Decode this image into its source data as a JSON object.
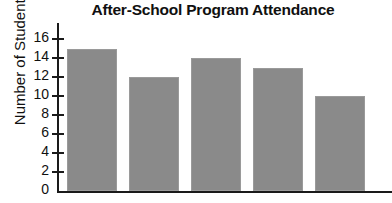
{
  "chart_data": {
    "type": "bar",
    "title": "After-School Program Attendance",
    "xlabel": "",
    "ylabel": "Number of Students",
    "categories": [
      "",
      "",
      "",
      "",
      ""
    ],
    "values": [
      15,
      12,
      14,
      13,
      10
    ],
    "ylim": [
      0,
      16
    ],
    "ytick_labels": [
      "0",
      "2",
      "4",
      "6",
      "8",
      "10",
      "12",
      "14",
      "16"
    ],
    "ytick_values": [
      0,
      2,
      4,
      6,
      8,
      10,
      12,
      14,
      16
    ],
    "grid": false,
    "legend": false,
    "bar_color": "#8a8a8a",
    "axis_color": "#1a1a1a",
    "background": "#ffffff"
  }
}
